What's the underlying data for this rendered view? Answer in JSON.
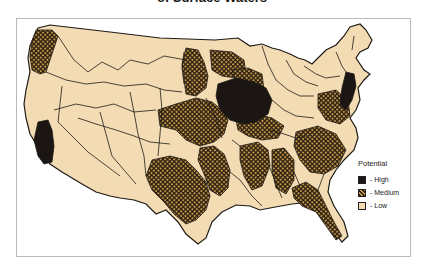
{
  "figure": {
    "title_visible": "of Surface Waters"
  },
  "legend": {
    "title": "Potential",
    "items": [
      {
        "label": "- High",
        "level": "high",
        "color": "#1b1613"
      },
      {
        "label": "- Medium",
        "level": "medium",
        "color": "#8a6a34",
        "pattern": "crosshatch"
      },
      {
        "label": "- Low",
        "level": "low",
        "color": "#f3dcb4"
      }
    ]
  },
  "map": {
    "region": "Contiguous United States",
    "unit_boundaries": "hydrologic sub-regions",
    "colors": {
      "land_low": "#f3dcb4",
      "boundary": "#1e1a15",
      "high": "#1b1613",
      "medium_fg": "#2a1e10",
      "medium_bg": "#c79a4c",
      "frame": "#b9b9b9"
    },
    "high_areas": [
      "Central California (Central Valley)",
      "Upper Mississippi / Illinois-Iowa",
      "New Jersey / Delaware-Hudson corridor"
    ],
    "medium_areas": [
      "Pacific Northwest coast",
      "Northern Great Plains / Red River",
      "Central Plains (Kansas-Nebraska)",
      "Texas",
      "Lower Mississippi Valley",
      "Ohio-Tennessee Valleys",
      "Southeast Atlantic (Carolinas, Georgia)",
      "Florida",
      "Chesapeake / Virginia"
    ]
  }
}
